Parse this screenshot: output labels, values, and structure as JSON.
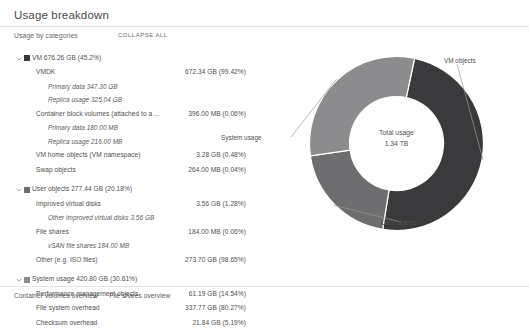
{
  "card": {
    "title": "Usage breakdown",
    "subhead": "Usage by categories",
    "collapse_all": "COLLAPSE ALL"
  },
  "colors": {
    "vm_objects": "#3a3a3c",
    "user_objects": "#6e6e70",
    "system_usage": "#8c8c8e",
    "text": "#4f4f4f",
    "rule": "#e4e4e4"
  },
  "rows": [
    {
      "level": 0,
      "name": "VM 676.26 GB (45.2%)",
      "value": "",
      "swatch": "vm_objects",
      "expanded": true
    },
    {
      "level": 1,
      "name": "VMDK",
      "value": "672.34 GB (99.42%)"
    },
    {
      "level": 2,
      "name": "Primary data 347.30 GB",
      "value": ""
    },
    {
      "level": 2,
      "name": "Replica usage 325.04 GB",
      "value": ""
    },
    {
      "level": 1,
      "name": "Container block volumes (attached to a ...",
      "value": "396.00 MB (0.06%)"
    },
    {
      "level": 2,
      "name": "Primary data 180.00 MB",
      "value": ""
    },
    {
      "level": 2,
      "name": "Replica usage 216.00 MB",
      "value": ""
    },
    {
      "level": 1,
      "name": "VM home objects (VM namespace)",
      "value": "3.28 GB (0.48%)"
    },
    {
      "level": 1,
      "name": "Swap objects",
      "value": "264.00 MB (0.04%)"
    },
    {
      "level": 0,
      "name": "User objects 277.44 GB (20.18%)",
      "value": "",
      "swatch": "user_objects",
      "expanded": true
    },
    {
      "level": 1,
      "name": "Improved virtual disks",
      "value": "3.56 GB (1.28%)"
    },
    {
      "level": 2,
      "name": "Other improved virtual disks 3.56 GB",
      "value": ""
    },
    {
      "level": 1,
      "name": "File shares",
      "value": "184.00 MB (0.06%)"
    },
    {
      "level": 2,
      "name": "vSAN file shares 184.00 MB",
      "value": ""
    },
    {
      "level": 1,
      "name": "Other (e.g. ISO files)",
      "value": "273.70 GB (98.65%)"
    },
    {
      "level": 0,
      "name": "System usage 420.80 GB (30.61%)",
      "value": "",
      "swatch": "system_usage",
      "expanded": true
    },
    {
      "level": 1,
      "name": "Performance management objects",
      "value": "61.19 GB (14.54%)"
    },
    {
      "level": 1,
      "name": "File system overhead",
      "value": "337.77 GB (80.27%)"
    },
    {
      "level": 1,
      "name": "Checksum overhead",
      "value": "21.84 GB (5.19%)"
    }
  ],
  "chart_data": {
    "type": "pie",
    "title": "Usage breakdown",
    "center_label": "Total usage",
    "center_value": "1.34 TB",
    "legend_position": "callouts",
    "labels": [
      "VM objects",
      "User objects",
      "System usage"
    ],
    "values": [
      676.26,
      277.44,
      420.8
    ],
    "units": "GB",
    "percents": [
      45.2,
      20.18,
      30.61
    ],
    "colors": [
      "#3a3a3c",
      "#6e6e70",
      "#8c8c8e"
    ],
    "callouts": {
      "vm_objects": "VM objects",
      "user_objects": "User objects",
      "system_usage": "System usage"
    }
  },
  "footer": {
    "links": [
      "Container volumes overview",
      "File shares overview"
    ]
  }
}
